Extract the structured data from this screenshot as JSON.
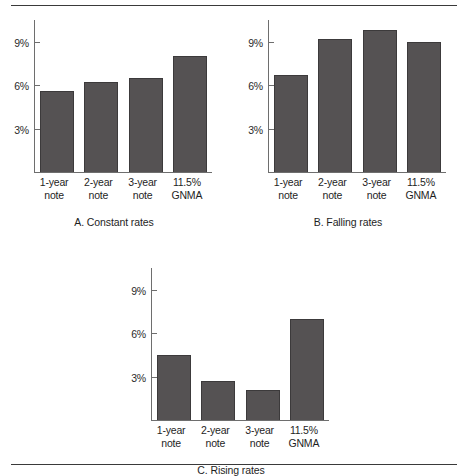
{
  "figure": {
    "rule_top": "horizontal-rule",
    "rule_bottom": "horizontal-rule"
  },
  "chart_data": [
    {
      "type": "bar",
      "panel": "A",
      "title": "A. Constant rates",
      "categories": [
        "1-year note",
        "2-year note",
        "3-year note",
        "11.5% GNMA"
      ],
      "category_lines": [
        [
          "1-year",
          "note"
        ],
        [
          "2-year",
          "note"
        ],
        [
          "3-year",
          "note"
        ],
        [
          "11.5%",
          "GNMA"
        ]
      ],
      "values": [
        5.6,
        6.2,
        6.5,
        8.0
      ],
      "xlabel": "",
      "ylabel": "",
      "ylim": [
        0,
        10.5
      ],
      "yticks": [
        3,
        6,
        9
      ],
      "ytick_labels": [
        "3%",
        "6%",
        "9%"
      ],
      "grid": false,
      "legend": "none",
      "bar_color": "#555253",
      "bar_edge_color": "#3c3a3b"
    },
    {
      "type": "bar",
      "panel": "B",
      "title": "B. Falling rates",
      "categories": [
        "1-year note",
        "2-year note",
        "3-year note",
        "11.5% GNMA"
      ],
      "category_lines": [
        [
          "1-year",
          "note"
        ],
        [
          "2-year",
          "note"
        ],
        [
          "3-year",
          "note"
        ],
        [
          "11.5%",
          "GNMA"
        ]
      ],
      "values": [
        6.7,
        9.2,
        9.8,
        9.0
      ],
      "xlabel": "",
      "ylabel": "",
      "ylim": [
        0,
        10.5
      ],
      "yticks": [
        3,
        6,
        9
      ],
      "ytick_labels": [
        "3%",
        "6%",
        "9%"
      ],
      "grid": false,
      "legend": "none",
      "bar_color": "#555253",
      "bar_edge_color": "#3c3a3b"
    },
    {
      "type": "bar",
      "panel": "C",
      "title": "C. Rising rates",
      "categories": [
        "1-year note",
        "2-year note",
        "3-year note",
        "11.5% GNMA"
      ],
      "category_lines": [
        [
          "1-year",
          "note"
        ],
        [
          "2-year",
          "note"
        ],
        [
          "3-year",
          "note"
        ],
        [
          "11.5%",
          "GNMA"
        ]
      ],
      "values": [
        4.5,
        2.7,
        2.1,
        7.0
      ],
      "xlabel": "",
      "ylabel": "",
      "ylim": [
        0,
        10.5
      ],
      "yticks": [
        3,
        6,
        9
      ],
      "ytick_labels": [
        "3%",
        "6%",
        "9%"
      ],
      "grid": false,
      "legend": "none",
      "bar_color": "#555253",
      "bar_edge_color": "#3c3a3b"
    }
  ]
}
